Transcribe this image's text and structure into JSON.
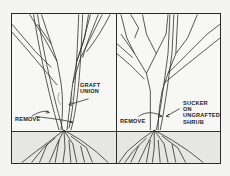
{
  "figure": {
    "panels": [
      {
        "id": "left",
        "title": "Grafted shrub",
        "labels": {
          "graft_union_line1": "GRAFT",
          "graft_union_line2": "UNION",
          "remove": "REMOVE"
        }
      },
      {
        "id": "right",
        "title": "Ungrafted shrub",
        "labels": {
          "sucker_line1": "SUCKER",
          "sucker_line2": "ON",
          "sucker_line3": "UNGRAFTED",
          "sucker_line4": "SHRUB",
          "remove": "REMOVE"
        }
      }
    ],
    "colors": {
      "ink": "#2a2a2a",
      "paper": "#f7f7f5",
      "soil": "#e6e6e3"
    }
  }
}
